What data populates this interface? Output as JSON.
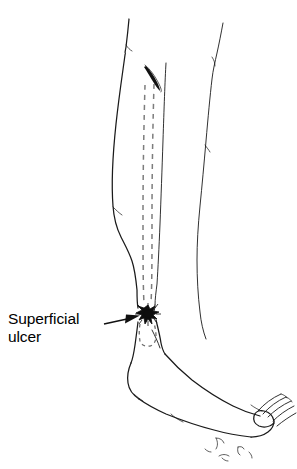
{
  "figure": {
    "annotations": [
      {
        "id": "superficial-ulcer",
        "label_line_1": "Superficial",
        "label_line_2": "ulcer",
        "leader_from": [
          104,
          324
        ],
        "leader_to": [
          139,
          316
        ],
        "points_to": "ulcer-blot"
      }
    ],
    "colors": {
      "background": "#ffffff",
      "ink": "#1a1a1a",
      "vein_dash": "#7d7d7d",
      "ulcer": "#0d0d0d",
      "label_text": "#000000"
    },
    "parts": {
      "near_leg": "near leg outline",
      "far_leg": "far leg outline",
      "foot": "foot in profile, toes at right",
      "vein_tract": "dashed superficial vein running down the shin",
      "vein_head": "solid lens-shaped proximal vein segment",
      "ulcer_blot": "dark irregular starburst at the medial ankle",
      "ankle_dashed_loop": "small dashed outline below the ulcer",
      "ground_marks": "small hair-like marks below the forefoot"
    }
  }
}
